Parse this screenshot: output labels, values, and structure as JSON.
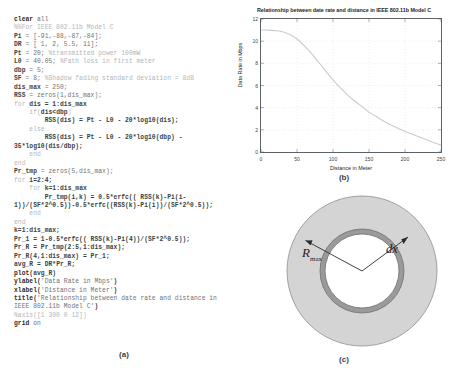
{
  "figure": {
    "panel_a_label": "(a)",
    "panel_b_label": "(b)",
    "panel_c_label": "(c)"
  },
  "code": {
    "language": "MATLAB",
    "lines": [
      [
        {
          "t": "clear",
          "c": "kw"
        },
        {
          "t": " all",
          "c": "pl"
        }
      ],
      [
        {
          "t": "%%For IEEE 802.11b Model C",
          "c": "cm"
        }
      ],
      [
        {
          "t": "Pi",
          "c": "nm"
        },
        {
          "t": " = [-91,-88,-87,-84];",
          "c": "pl"
        }
      ],
      [
        {
          "t": "DR",
          "c": "nm"
        },
        {
          "t": " = [ 1, 2, 5.5, 11];",
          "c": "pl"
        }
      ],
      [
        {
          "t": "Pt",
          "c": "nm"
        },
        {
          "t": " = 20; ",
          "c": "pl"
        },
        {
          "t": "%transmitted power 100mW",
          "c": "cm"
        }
      ],
      [
        {
          "t": "L0",
          "c": "nm"
        },
        {
          "t": " = 40.05; ",
          "c": "pl"
        },
        {
          "t": "%Path loss in first meter",
          "c": "cm"
        }
      ],
      [
        {
          "t": "dbp",
          "c": "nm"
        },
        {
          "t": " = 5;",
          "c": "pl"
        }
      ],
      [
        {
          "t": "SF",
          "c": "nm"
        },
        {
          "t": " = 8; ",
          "c": "pl"
        },
        {
          "t": "%Shadow fading standard deviation = 8dB",
          "c": "cm"
        }
      ],
      [
        {
          "t": "dis_max",
          "c": "nm"
        },
        {
          "t": " = 250;",
          "c": "pl"
        }
      ],
      [
        {
          "t": "RSS",
          "c": "nm"
        },
        {
          "t": " = zeros(1,dis_max);",
          "c": "pl"
        }
      ],
      [
        {
          "t": "for",
          "c": "cm"
        },
        {
          "t": " ",
          "c": "pl"
        },
        {
          "t": "dis = 1:dis_max",
          "c": "nm"
        }
      ],
      [
        {
          "t": "    if",
          "c": "cm"
        },
        {
          "t": "(",
          "c": "cm"
        },
        {
          "t": "dis<dbp",
          "c": "nm"
        },
        {
          "t": ")",
          "c": "cm"
        }
      ],
      [
        {
          "t": "        RSS(dis) = Pt - L0 - 20*log10(dis);",
          "c": "nm"
        }
      ],
      [
        {
          "t": "    else",
          "c": "cm"
        }
      ],
      [
        {
          "t": "        RSS(dis) = Pt - L0 - 20*log10(dbp) -",
          "c": "nm"
        }
      ],
      [
        {
          "t": "35*log10(dis/dbp);",
          "c": "nm"
        }
      ],
      [
        {
          "t": "    end",
          "c": "cm"
        }
      ],
      [
        {
          "t": "end",
          "c": "cm"
        }
      ],
      [
        {
          "t": "Pr_tmp",
          "c": "nm"
        },
        {
          "t": " = zeros(5,dis_max);",
          "c": "pl"
        }
      ],
      [
        {
          "t": "for",
          "c": "cm"
        },
        {
          "t": " ",
          "c": "pl"
        },
        {
          "t": "i=2:4;",
          "c": "nm"
        }
      ],
      [
        {
          "t": "    for",
          "c": "cm"
        },
        {
          "t": " ",
          "c": "pl"
        },
        {
          "t": "k=1:dis_max",
          "c": "nm"
        }
      ],
      [
        {
          "t": "        Pr_tmp(i,k) = 0.5*erfc(( RSS(k)-Pi(i-",
          "c": "nm"
        }
      ],
      [
        {
          "t": "1))/(SF*2^0.5))-0.5*erfc((RSS(k)-Pi(i))/(SF*2^0.5));",
          "c": "nm"
        }
      ],
      [
        {
          "t": "    end",
          "c": "cm"
        }
      ],
      [
        {
          "t": "end",
          "c": "cm"
        }
      ],
      [
        {
          "t": "k=1:dis_max;",
          "c": "nm"
        }
      ],
      [
        {
          "t": "Pr_1",
          "c": "nm"
        },
        {
          "t": " = 1-0.5*erfc(( RSS(k)-Pi(4))/(SF*2^0.5));",
          "c": "nm"
        }
      ],
      [
        {
          "t": "Pr_R",
          "c": "nm"
        },
        {
          "t": " = Pr_tmp(2:5,1:dis_max);",
          "c": "nm"
        }
      ],
      [
        {
          "t": "Pr_R(4,1:dis_max) = Pr_1;",
          "c": "nm"
        }
      ],
      [
        {
          "t": "avg_R",
          "c": "nm"
        },
        {
          "t": " = DR*Pr_R;",
          "c": "nm"
        }
      ],
      [
        {
          "t": "plot",
          "c": "kw"
        },
        {
          "t": "(avg_R)",
          "c": "nm"
        }
      ],
      [
        {
          "t": "ylabel",
          "c": "kw"
        },
        {
          "t": "(",
          "c": "nm"
        },
        {
          "t": "'Data Rate in Mbps'",
          "c": "pl"
        },
        {
          "t": ")",
          "c": "nm"
        }
      ],
      [
        {
          "t": "xlabel",
          "c": "kw"
        },
        {
          "t": "(",
          "c": "nm"
        },
        {
          "t": "'Distance in Meter'",
          "c": "pl"
        },
        {
          "t": ")",
          "c": "nm"
        }
      ],
      [
        {
          "t": "title",
          "c": "kw"
        },
        {
          "t": "(",
          "c": "nm"
        },
        {
          "t": "'Relationship between date rate and distance in",
          "c": "pl"
        }
      ],
      [
        {
          "t": "IEEE 802.11b Model C'",
          "c": "pl"
        },
        {
          "t": ")",
          "c": "nm"
        }
      ],
      [
        {
          "t": "%axis([1 300 0 12])",
          "c": "cm"
        }
      ],
      [
        {
          "t": "grid",
          "c": "kw"
        },
        {
          "t": " on",
          "c": "pl"
        }
      ]
    ]
  },
  "chart_data": {
    "type": "line",
    "title": "Relationship between date rate and distance in IEEE 802.11b Model C",
    "xlabel": "Distance in Meter",
    "ylabel": "Data Rate in Mbps",
    "xlim": [
      0,
      250
    ],
    "ylim": [
      0,
      12
    ],
    "xticks": [
      0,
      50,
      100,
      150,
      200,
      250
    ],
    "yticks": [
      0,
      2,
      4,
      6,
      8,
      10,
      12
    ],
    "grid": true,
    "legend": "none",
    "series": [
      {
        "name": "Average data rate",
        "color": "#c8ccd0",
        "x": [
          0,
          10,
          20,
          30,
          40,
          50,
          60,
          70,
          80,
          90,
          100,
          110,
          120,
          130,
          140,
          150,
          160,
          170,
          180,
          190,
          200,
          210,
          220,
          230,
          240,
          250
        ],
        "y": [
          11.0,
          11.0,
          10.95,
          10.85,
          10.6,
          10.2,
          9.6,
          8.9,
          8.1,
          7.3,
          6.5,
          5.8,
          5.15,
          4.6,
          4.1,
          3.6,
          3.2,
          2.8,
          2.45,
          2.15,
          1.85,
          1.6,
          1.35,
          1.1,
          0.85,
          0.6
        ]
      }
    ]
  },
  "annulus": {
    "outer_label": "R",
    "outer_label_sub": "max",
    "ring_label": "dx",
    "outer_fill": "#d4d4d4",
    "ring_fill": "#9a9a9a",
    "inner_fill": "#ffffff"
  }
}
